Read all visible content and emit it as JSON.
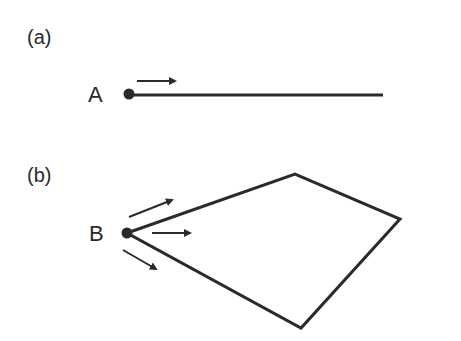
{
  "panels": [
    {
      "label": "(a)",
      "point_label": "A",
      "shape": "line",
      "description": "Single straight line from point A with one arrow pointing along it"
    },
    {
      "label": "(b)",
      "point_label": "B",
      "shape": "quadrilateral",
      "description": "Quadrilateral with vertex at point B and three arrows diverging from B"
    }
  ],
  "colors": {
    "stroke": "#2a2a2a",
    "background": "#ffffff"
  }
}
